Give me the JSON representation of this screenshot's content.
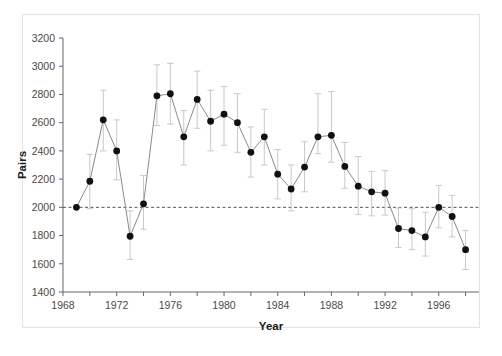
{
  "figure": {
    "top_caption": "",
    "background_color": "#ffffff",
    "frame_color": "#e2e2e2"
  },
  "chart_data": {
    "type": "line",
    "title": "",
    "subtitle": "",
    "xlabel": "Year",
    "ylabel": "Pairs",
    "xlim": [
      1968,
      1999
    ],
    "ylim": [
      1400,
      3200
    ],
    "yticks": [
      1400,
      1600,
      1800,
      2000,
      2200,
      2400,
      2600,
      2800,
      3000,
      3200
    ],
    "ytick_labels": [
      "1400",
      "1600",
      "1800",
      "2000",
      "2200",
      "2400",
      "2600",
      "2800",
      "3000",
      "3200"
    ],
    "xticks": [
      1968,
      1970,
      1972,
      1974,
      1976,
      1978,
      1980,
      1982,
      1984,
      1986,
      1988,
      1990,
      1992,
      1994,
      1996,
      1998
    ],
    "xtick_labels": [
      "1968",
      "",
      "1972",
      "",
      "1976",
      "",
      "1980",
      "",
      "1984",
      "",
      "1988",
      "",
      "1992",
      "",
      "1996",
      ""
    ],
    "grid": false,
    "legend": null,
    "marker": "filled-circle",
    "marker_color": "#111111",
    "line_color": "#8a8a8a",
    "errorbar_color": "#c8c8c8",
    "reference_line": {
      "value": 2000,
      "style": "dashed",
      "color": "#555555",
      "label": ""
    },
    "x": [
      1969,
      1970,
      1971,
      1972,
      1973,
      1974,
      1975,
      1976,
      1977,
      1978,
      1979,
      1980,
      1981,
      1982,
      1983,
      1984,
      1985,
      1986,
      1987,
      1988,
      1989,
      1990,
      1991,
      1992,
      1993,
      1994,
      1995,
      1996,
      1997,
      1998
    ],
    "values": [
      2000,
      2185,
      2620,
      2400,
      1795,
      2025,
      2790,
      2805,
      2500,
      2765,
      2610,
      2660,
      2600,
      2390,
      2500,
      2235,
      2130,
      2285,
      2500,
      2510,
      2290,
      2150,
      2110,
      2100,
      1850,
      1835,
      1790,
      2000,
      1935,
      1700
    ],
    "err_low": [
      2000,
      1990,
      2400,
      2195,
      1630,
      1845,
      2580,
      2590,
      2300,
      2560,
      2400,
      2440,
      2390,
      2215,
      2300,
      2060,
      1975,
      2110,
      2380,
      2320,
      2135,
      1950,
      1940,
      1945,
      1715,
      1700,
      1655,
      1855,
      1790,
      1560
    ],
    "err_high": [
      2000,
      2375,
      2830,
      2620,
      1975,
      2225,
      3010,
      3020,
      2685,
      2965,
      2830,
      2855,
      2805,
      2570,
      2695,
      2410,
      2300,
      2465,
      2805,
      2820,
      2460,
      2360,
      2255,
      2260,
      1995,
      1990,
      1965,
      2155,
      2085,
      1835
    ],
    "series": [
      {
        "name": "Pairs",
        "values": [
          2000,
          2185,
          2620,
          2400,
          1795,
          2025,
          2790,
          2805,
          2500,
          2765,
          2610,
          2660,
          2600,
          2390,
          2500,
          2235,
          2130,
          2285,
          2500,
          2510,
          2290,
          2150,
          2110,
          2100,
          1850,
          1835,
          1790,
          2000,
          1935,
          1700
        ]
      }
    ]
  }
}
